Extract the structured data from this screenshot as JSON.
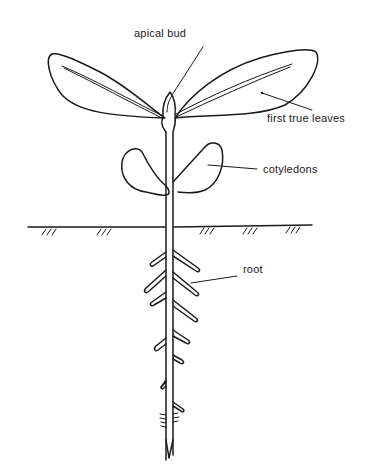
{
  "diagram": {
    "labels": {
      "apical_bud": "apical bud",
      "first_true_leaves": "first true leaves",
      "cotyledons": "cotyledons",
      "root": "root"
    },
    "colors": {
      "ink": "#1a1a1a",
      "background": "#ffffff"
    }
  }
}
